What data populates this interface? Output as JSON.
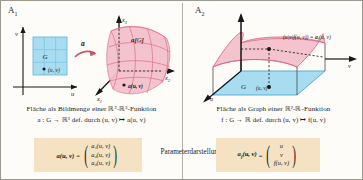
{
  "figure": {
    "panels": [
      {
        "tag": "A",
        "tag_sub": "1",
        "diagram": {
          "domain_axes": {
            "horizontal": "u",
            "vertical": "v"
          },
          "domain_region_label": "G",
          "domain_point_label": "(u, v)",
          "map_arrow_label": "a",
          "target_axes": {
            "x1": "x",
            "x1_sub": "1",
            "x2": "x",
            "x2_sub": "2",
            "x3": "x",
            "x3_sub": "3"
          },
          "image_label": "a[G]",
          "image_point_label": "a(u, v)"
        },
        "caption_line1": "Fläche als Bildmenge einer ℝ²-ℝ³-Funktion",
        "caption_line2": "a : G → ℝ³ def. durch (u, v) ↦ a(u, v)",
        "formula": {
          "lhs": "a(u, v)",
          "lhs_sub": "",
          "equals": "=",
          "components": [
            "a₁(u, v)",
            "a₂(u, v)",
            "a₃(u, v)"
          ]
        }
      },
      {
        "tag": "A",
        "tag_sub": "2",
        "diagram": {
          "domain_axes": {
            "horizontal": "v",
            "vertical": "u"
          },
          "domain_region_label": "G",
          "domain_point_label": "(u, v)",
          "graph_point_label": "(u|v|f(u, v)) = aƒ(u, v)",
          "graph_point_label_main": "(u|v|f(u, v)) =",
          "graph_point_label_sub_base": "a",
          "graph_point_label_sub": "f",
          "graph_point_label_tail": "(u, v)"
        },
        "caption_line1": "Fläche als Graph einer ℝ²-ℝ-Funktion",
        "caption_line2": "f : G → ℝ def. durch (u, v) ↦ f(u, v)",
        "formula": {
          "lhs": "a",
          "lhs_sub": "f",
          "lhs_tail": "(u, v)",
          "equals": "=",
          "components": [
            "u",
            "v",
            "f(u, v)"
          ]
        }
      }
    ],
    "center_label": "Parameterdarstellung",
    "colors": {
      "domain_fill": "#a8dcf0",
      "domain_stroke": "#4ea8cc",
      "surface_fill": "#f3c0cc",
      "surface_stroke": "#e0637f",
      "formula_box": "#f4e2c2",
      "axis": "#17171a",
      "border": "#9a9a90"
    }
  }
}
